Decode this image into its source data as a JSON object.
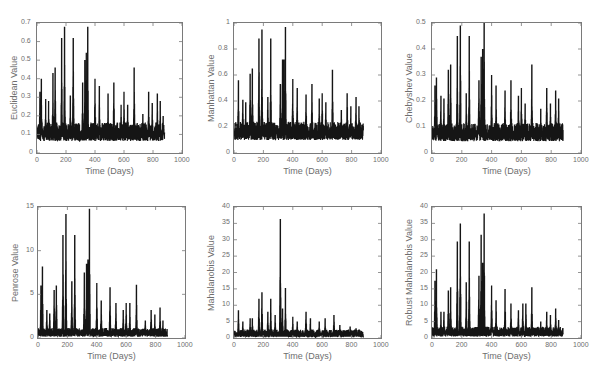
{
  "chart_data": [
    {
      "type": "line",
      "title": "",
      "xlabel": "Time (Days)",
      "ylabel": "Euclidean Value",
      "xlim": [
        0,
        1000
      ],
      "ylim": [
        0,
        0.7
      ],
      "xticks": [
        0,
        200,
        400,
        600,
        800,
        1000
      ],
      "yticks": [
        0,
        0.1,
        0.2,
        0.3,
        0.4,
        0.5,
        0.6,
        0.7
      ],
      "series": [
        {
          "name": "Euclidean",
          "baseline": 0.1,
          "noise": 0.1,
          "peaks": [
            [
              20,
              0.33
            ],
            [
              30,
              0.4
            ],
            [
              60,
              0.29
            ],
            [
              80,
              0.28
            ],
            [
              110,
              0.43
            ],
            [
              125,
              0.46
            ],
            [
              170,
              0.62
            ],
            [
              190,
              0.68
            ],
            [
              230,
              0.31
            ],
            [
              250,
              0.62
            ],
            [
              315,
              0.38
            ],
            [
              330,
              0.5
            ],
            [
              340,
              0.54
            ],
            [
              350,
              0.68
            ],
            [
              400,
              0.4
            ],
            [
              430,
              0.36
            ],
            [
              490,
              0.32
            ],
            [
              530,
              0.38
            ],
            [
              580,
              0.26
            ],
            [
              600,
              0.33
            ],
            [
              625,
              0.26
            ],
            [
              670,
              0.46
            ],
            [
              730,
              0.21
            ],
            [
              770,
              0.33
            ],
            [
              795,
              0.27
            ],
            [
              830,
              0.32
            ],
            [
              850,
              0.28
            ],
            [
              870,
              0.2
            ]
          ]
        }
      ],
      "x_extent": [
        0,
        880
      ],
      "grid": false
    },
    {
      "type": "line",
      "xlabel": "Time (Days)",
      "ylabel": "Manhattan Value",
      "xlim": [
        0,
        1000
      ],
      "ylim": [
        0,
        1
      ],
      "xticks": [
        0,
        200,
        400,
        600,
        800,
        1000
      ],
      "yticks": [
        0,
        0.2,
        0.4,
        0.6,
        0.8,
        1
      ],
      "series": [
        {
          "name": "Manhattan",
          "baseline": 0.15,
          "noise": 0.14,
          "peaks": [
            [
              30,
              0.56
            ],
            [
              60,
              0.41
            ],
            [
              80,
              0.39
            ],
            [
              110,
              0.61
            ],
            [
              125,
              0.65
            ],
            [
              170,
              0.88
            ],
            [
              190,
              0.95
            ],
            [
              230,
              0.43
            ],
            [
              250,
              0.88
            ],
            [
              315,
              0.53
            ],
            [
              330,
              0.72
            ],
            [
              340,
              0.72
            ],
            [
              350,
              0.97
            ],
            [
              400,
              0.57
            ],
            [
              430,
              0.5
            ],
            [
              490,
              0.45
            ],
            [
              530,
              0.53
            ],
            [
              580,
              0.42
            ],
            [
              600,
              0.46
            ],
            [
              625,
              0.39
            ],
            [
              670,
              0.64
            ],
            [
              730,
              0.33
            ],
            [
              770,
              0.46
            ],
            [
              795,
              0.36
            ],
            [
              830,
              0.43
            ],
            [
              850,
              0.36
            ]
          ]
        }
      ],
      "x_extent": [
        0,
        880
      ],
      "grid": false
    },
    {
      "type": "line",
      "xlabel": "Time (Days)",
      "ylabel": "Chebyshev Value",
      "xlim": [
        0,
        1000
      ],
      "ylim": [
        0,
        0.5
      ],
      "xticks": [
        0,
        200,
        400,
        600,
        800,
        1000
      ],
      "yticks": [
        0,
        0.1,
        0.2,
        0.3,
        0.4,
        0.5
      ],
      "series": [
        {
          "name": "Chebyshev",
          "baseline": 0.07,
          "noise": 0.07,
          "peaks": [
            [
              20,
              0.26
            ],
            [
              30,
              0.29
            ],
            [
              60,
              0.22
            ],
            [
              80,
              0.21
            ],
            [
              110,
              0.32
            ],
            [
              125,
              0.34
            ],
            [
              170,
              0.45
            ],
            [
              190,
              0.49
            ],
            [
              230,
              0.23
            ],
            [
              250,
              0.45
            ],
            [
              315,
              0.28
            ],
            [
              330,
              0.37
            ],
            [
              340,
              0.4
            ],
            [
              350,
              0.5
            ],
            [
              400,
              0.3
            ],
            [
              430,
              0.26
            ],
            [
              490,
              0.24
            ],
            [
              530,
              0.28
            ],
            [
              580,
              0.22
            ],
            [
              600,
              0.25
            ],
            [
              625,
              0.19
            ],
            [
              670,
              0.34
            ],
            [
              730,
              0.17
            ],
            [
              770,
              0.25
            ],
            [
              795,
              0.19
            ],
            [
              830,
              0.24
            ],
            [
              850,
              0.21
            ]
          ]
        }
      ],
      "x_extent": [
        0,
        880
      ],
      "grid": false
    },
    {
      "type": "line",
      "xlabel": "Time (Days)",
      "ylabel": "Penrose Value",
      "xlim": [
        0,
        1000
      ],
      "ylim": [
        0,
        15
      ],
      "xticks": [
        0,
        200,
        400,
        600,
        800,
        1000
      ],
      "yticks": [
        0,
        5,
        10,
        15
      ],
      "series": [
        {
          "name": "Penrose",
          "baseline": 0.5,
          "noise": 1.0,
          "peaks": [
            [
              20,
              6
            ],
            [
              30,
              8.2
            ],
            [
              60,
              3.2
            ],
            [
              80,
              2.8
            ],
            [
              110,
              5.5
            ],
            [
              125,
              6
            ],
            [
              170,
              11.8
            ],
            [
              190,
              14.2
            ],
            [
              230,
              6.5
            ],
            [
              250,
              11.8
            ],
            [
              315,
              7.5
            ],
            [
              330,
              8.5
            ],
            [
              340,
              9
            ],
            [
              350,
              14.8
            ],
            [
              400,
              6.3
            ],
            [
              430,
              4.3
            ],
            [
              490,
              5.8
            ],
            [
              530,
              4
            ],
            [
              580,
              3.2
            ],
            [
              600,
              4
            ],
            [
              625,
              4
            ],
            [
              670,
              6.1
            ],
            [
              730,
              2
            ],
            [
              770,
              3.2
            ],
            [
              795,
              2.7
            ],
            [
              830,
              3.5
            ],
            [
              850,
              2
            ]
          ]
        }
      ],
      "x_extent": [
        0,
        880
      ],
      "grid": false
    },
    {
      "type": "line",
      "xlabel": "Time (Days)",
      "ylabel": "Mahalanobis Value",
      "xlim": [
        0,
        1000
      ],
      "ylim": [
        0,
        40
      ],
      "xticks": [
        0,
        200,
        400,
        600,
        800,
        1000
      ],
      "yticks": [
        0,
        5,
        10,
        15,
        20,
        25,
        30,
        35,
        40
      ],
      "series": [
        {
          "name": "Mahalanobis",
          "baseline": 1.0,
          "noise": 2.5,
          "peaks": [
            [
              30,
              8.5
            ],
            [
              60,
              5
            ],
            [
              110,
              6
            ],
            [
              125,
              6
            ],
            [
              170,
              12
            ],
            [
              190,
              14
            ],
            [
              230,
              8
            ],
            [
              250,
              12
            ],
            [
              280,
              7
            ],
            [
              315,
              36.3
            ],
            [
              330,
              9
            ],
            [
              350,
              15.3
            ],
            [
              400,
              6.5
            ],
            [
              430,
              5
            ],
            [
              490,
              8
            ],
            [
              520,
              6
            ],
            [
              580,
              5
            ],
            [
              620,
              6
            ],
            [
              680,
              7
            ],
            [
              720,
              4
            ],
            [
              790,
              3.5
            ],
            [
              830,
              3
            ]
          ]
        }
      ],
      "x_extent": [
        0,
        880
      ],
      "grid": false
    },
    {
      "type": "line",
      "xlabel": "Time (Days)",
      "ylabel": "Robust Mahalanobis Value",
      "xlim": [
        0,
        1000
      ],
      "ylim": [
        0,
        40
      ],
      "xticks": [
        0,
        200,
        400,
        600,
        800,
        1000
      ],
      "yticks": [
        0,
        5,
        10,
        15,
        20,
        25,
        30,
        35,
        40
      ],
      "series": [
        {
          "name": "Robust Mahalanobis",
          "baseline": 1.5,
          "noise": 3.0,
          "peaks": [
            [
              20,
              17.5
            ],
            [
              30,
              21
            ],
            [
              60,
              8
            ],
            [
              80,
              8
            ],
            [
              110,
              14.5
            ],
            [
              125,
              15.5
            ],
            [
              170,
              29.5
            ],
            [
              190,
              35
            ],
            [
              230,
              17
            ],
            [
              250,
              29.5
            ],
            [
              315,
              19
            ],
            [
              330,
              31.5
            ],
            [
              340,
              23
            ],
            [
              350,
              38
            ],
            [
              400,
              16
            ],
            [
              430,
              11.5
            ],
            [
              490,
              15
            ],
            [
              530,
              10.5
            ],
            [
              580,
              8.5
            ],
            [
              610,
              10.5
            ],
            [
              630,
              10.5
            ],
            [
              670,
              15.5
            ],
            [
              730,
              5
            ],
            [
              770,
              8
            ],
            [
              795,
              7
            ],
            [
              830,
              9
            ],
            [
              850,
              5.5
            ]
          ]
        }
      ],
      "x_extent": [
        0,
        880
      ],
      "grid": false
    }
  ],
  "panels": [
    {
      "ylabel": "Euclidean Value",
      "xlabel": "Time (Days)",
      "xticks": [
        "0",
        "200",
        "400",
        "600",
        "800",
        "1000"
      ],
      "yticks": [
        "0",
        "0.1",
        "0.2",
        "0.3",
        "0.4",
        "0.5",
        "0.6",
        "0.7"
      ]
    },
    {
      "ylabel": "Manhattan Value",
      "xlabel": "Time (Days)",
      "xticks": [
        "0",
        "200",
        "400",
        "600",
        "800",
        "1000"
      ],
      "yticks": [
        "0",
        "0.2",
        "0.4",
        "0.6",
        "0.8",
        "1"
      ]
    },
    {
      "ylabel": "Chebyshev Value",
      "xlabel": "Time (Days)",
      "xticks": [
        "0",
        "200",
        "400",
        "600",
        "800",
        "1000"
      ],
      "yticks": [
        "0",
        "0.1",
        "0.2",
        "0.3",
        "0.4",
        "0.5"
      ]
    },
    {
      "ylabel": "Penrose Value",
      "xlabel": "Time (Days)",
      "xticks": [
        "0",
        "200",
        "400",
        "600",
        "800",
        "1000"
      ],
      "yticks": [
        "0",
        "5",
        "10",
        "15"
      ]
    },
    {
      "ylabel": "Mahalanobis Value",
      "xlabel": "Time (Days)",
      "xticks": [
        "0",
        "200",
        "400",
        "600",
        "800",
        "1000"
      ],
      "yticks": [
        "0",
        "5",
        "10",
        "15",
        "20",
        "25",
        "30",
        "35",
        "40"
      ]
    },
    {
      "ylabel": "Robust Mahalanobis Value",
      "xlabel": "Time (Days)",
      "xticks": [
        "0",
        "200",
        "400",
        "600",
        "800",
        "1000"
      ],
      "yticks": [
        "0",
        "5",
        "10",
        "15",
        "20",
        "25",
        "30",
        "35",
        "40"
      ]
    }
  ],
  "colors": {
    "line": "#151515",
    "axis": "#7a7a7a",
    "text": "#6e6e6e"
  }
}
